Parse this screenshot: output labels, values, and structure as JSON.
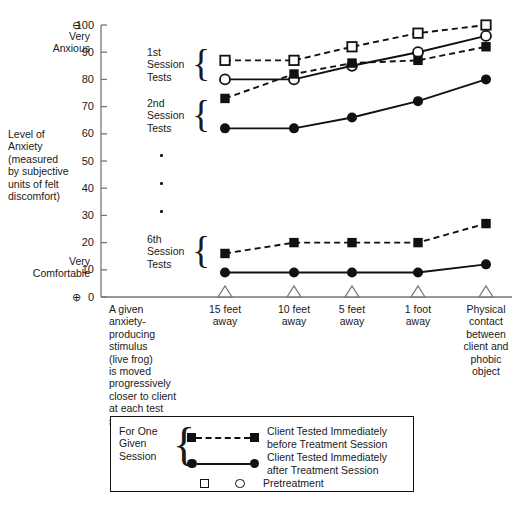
{
  "figure": {
    "y_axis": {
      "label_lines": [
        "Level of",
        "Anxiety",
        "(measured",
        "by subjective",
        "units of felt",
        "discomfort)"
      ],
      "top_anchor_lines": [
        "Very",
        "Anxious"
      ],
      "bottom_anchor_lines": [
        "Very",
        "Comfortable"
      ],
      "top_symbol": "⊖",
      "bottom_symbol": "⊕",
      "ticks": [
        "100",
        "90",
        "80",
        "70",
        "60",
        "50",
        "40",
        "30",
        "20",
        "10",
        "0"
      ],
      "min": 0,
      "max": 100
    },
    "x_axis": {
      "note_lines": [
        "A given",
        "anxiety-",
        "producing",
        "stimulus",
        "(live frog)",
        "is moved",
        "progressively",
        "closer to client",
        "at each test",
        "session"
      ],
      "categories": [
        {
          "lines": [
            "15 feet",
            "away"
          ]
        },
        {
          "lines": [
            "10 feet",
            "away"
          ]
        },
        {
          "lines": [
            "5 feet",
            "away"
          ]
        },
        {
          "lines": [
            "1 foot",
            "away"
          ]
        },
        {
          "lines": [
            "Physical",
            "contact",
            "between",
            "client and",
            "phobic",
            "object"
          ]
        }
      ]
    },
    "group_labels": [
      {
        "lines": [
          "1st",
          "Session",
          "Tests"
        ]
      },
      {
        "lines": [
          "2nd",
          "Session",
          "Tests"
        ]
      },
      {
        "lines": [
          "6th",
          "Session",
          "Tests"
        ]
      }
    ],
    "ellipsis_marker": "·"
  },
  "legend": {
    "bracket_label_lines": [
      "For One",
      "Given",
      "Session"
    ],
    "entries": [
      {
        "marker": "filled-square",
        "line": "dashed",
        "text_lines": [
          "Client Tested Immediately",
          "before Treatment Session"
        ]
      },
      {
        "marker": "filled-circle",
        "line": "solid",
        "text_lines": [
          "Client Tested Immediately",
          "after Treatment Session"
        ]
      }
    ],
    "pretreatment": {
      "square_marker": "open-square",
      "circle_marker": "open-circle",
      "label": "Pretreatment"
    }
  },
  "chart_data": {
    "type": "line",
    "title": "",
    "xlabel": "",
    "ylabel": "Level of Anxiety (measured by subjective units of felt discomfort)",
    "ylim": [
      0,
      100
    ],
    "yticks": [
      0,
      10,
      20,
      30,
      40,
      50,
      60,
      70,
      80,
      90,
      100
    ],
    "grid": false,
    "legend_position": "bottom",
    "categories": [
      "15 feet away",
      "10 feet away",
      "5 feet away",
      "1 foot away",
      "Physical contact between client and phobic object"
    ],
    "series": [
      {
        "name": "Pretreatment — open square (1st Session, before)",
        "marker": "open-square",
        "line": "dashed",
        "values": [
          87,
          87,
          92,
          97,
          100
        ]
      },
      {
        "name": "Pretreatment — open circle (1st Session, after)",
        "marker": "open-circle",
        "line": "solid",
        "values": [
          80,
          80,
          85,
          90,
          96
        ]
      },
      {
        "name": "2nd Session — Client Tested Immediately before Treatment Session",
        "marker": "filled-square",
        "line": "dashed",
        "values": [
          73,
          82,
          86,
          87,
          92
        ]
      },
      {
        "name": "2nd Session — Client Tested Immediately after Treatment Session",
        "marker": "filled-circle",
        "line": "solid",
        "values": [
          62,
          62,
          66,
          72,
          80
        ]
      },
      {
        "name": "6th Session — Client Tested Immediately before Treatment Session",
        "marker": "filled-square",
        "line": "dashed",
        "values": [
          16,
          20,
          20,
          20,
          27
        ]
      },
      {
        "name": "6th Session — Client Tested Immediately after Treatment Session",
        "marker": "filled-circle",
        "line": "solid",
        "values": [
          9,
          9,
          9,
          9,
          12
        ]
      }
    ]
  }
}
